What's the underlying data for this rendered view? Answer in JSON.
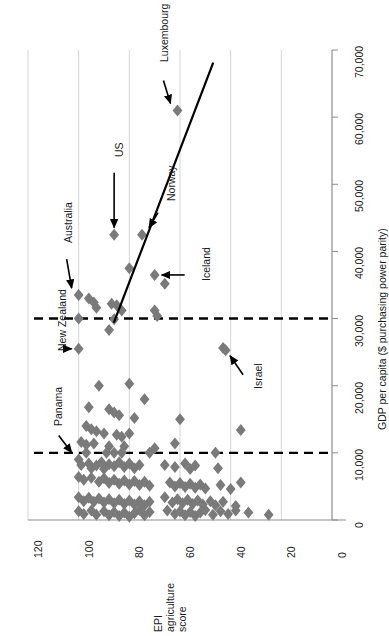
{
  "chart_data": {
    "type": "scatter",
    "title": "",
    "orientation": "rotated-90",
    "xlabel": "EPI agriculture score",
    "ylabel": "GDP per capita ($ purchasing power parity)",
    "xlim": [
      0,
      120
    ],
    "ylim": [
      0,
      70000
    ],
    "x_reversed": true,
    "grid": "x-gridlines-only",
    "legend": "none",
    "xticks": [
      120,
      100,
      80,
      60,
      40,
      20,
      0
    ],
    "xtick_labels": [
      "120",
      "100",
      "80",
      "60",
      "40",
      "20",
      "0"
    ],
    "yticks": [
      0,
      10000,
      20000,
      30000,
      40000,
      50000,
      60000,
      70000
    ],
    "ytick_labels": [
      "0",
      "10,000",
      "20,000",
      "30,000",
      "40,000",
      "50,000",
      "60,000",
      "70,000"
    ],
    "marker": {
      "shape": "diamond",
      "color": "#7a7a7a",
      "size": 6
    },
    "reference_lines": [
      {
        "axis": "gdp",
        "value": 30000,
        "style": "dashed",
        "color": "#000000"
      },
      {
        "axis": "gdp",
        "value": 10000,
        "style": "dashed",
        "color": "#000000"
      }
    ],
    "trendline": {
      "style": "solid",
      "color": "#000000",
      "width": 2.2,
      "from": {
        "epi": 86,
        "gdp": 29500
      },
      "to": {
        "epi": 47,
        "gdp": 68000
      }
    },
    "annotations": [
      {
        "label": "Luxembourg",
        "epi": 61,
        "gdp": 61000
      },
      {
        "label": "US",
        "epi": 86,
        "gdp": 42500
      },
      {
        "label": "Norway",
        "epi": 75,
        "gdp": 42500
      },
      {
        "label": "Iceland",
        "epi": 70,
        "gdp": 36500
      },
      {
        "label": "Australia",
        "epi": 100,
        "gdp": 33500
      },
      {
        "label": "New Zealand",
        "epi": 100,
        "gdp": 25500
      },
      {
        "label": "Panama",
        "epi": 100,
        "gdp": 9000
      },
      {
        "label": "Israel",
        "epi": 43,
        "gdp": 25500
      }
    ],
    "points": [
      {
        "epi": 61,
        "gdp": 61000
      },
      {
        "epi": 86,
        "gdp": 42500
      },
      {
        "epi": 75,
        "gdp": 42500
      },
      {
        "epi": 80,
        "gdp": 37500
      },
      {
        "epi": 70,
        "gdp": 36500
      },
      {
        "epi": 66,
        "gdp": 35200
      },
      {
        "epi": 100,
        "gdp": 33500
      },
      {
        "epi": 96,
        "gdp": 33000
      },
      {
        "epi": 94,
        "gdp": 32400
      },
      {
        "epi": 93,
        "gdp": 31600
      },
      {
        "epi": 87,
        "gdp": 32200
      },
      {
        "epi": 85,
        "gdp": 32000
      },
      {
        "epi": 83,
        "gdp": 31200
      },
      {
        "epi": 100,
        "gdp": 30000
      },
      {
        "epi": 86,
        "gdp": 29900
      },
      {
        "epi": 70,
        "gdp": 31200
      },
      {
        "epi": 69,
        "gdp": 30400
      },
      {
        "epi": 88,
        "gdp": 28300
      },
      {
        "epi": 100,
        "gdp": 25500
      },
      {
        "epi": 43,
        "gdp": 25600
      },
      {
        "epi": 42,
        "gdp": 25300
      },
      {
        "epi": 92,
        "gdp": 20000
      },
      {
        "epi": 80,
        "gdp": 20300
      },
      {
        "epi": 74,
        "gdp": 18000
      },
      {
        "epi": 96,
        "gdp": 16800
      },
      {
        "epi": 88,
        "gdp": 16500
      },
      {
        "epi": 86,
        "gdp": 16000
      },
      {
        "epi": 84,
        "gdp": 15600
      },
      {
        "epi": 78,
        "gdp": 15200
      },
      {
        "epi": 60,
        "gdp": 15000
      },
      {
        "epi": 97,
        "gdp": 14000
      },
      {
        "epi": 95,
        "gdp": 13500
      },
      {
        "epi": 93,
        "gdp": 13200
      },
      {
        "epi": 90,
        "gdp": 12900
      },
      {
        "epi": 85,
        "gdp": 12700
      },
      {
        "epi": 83,
        "gdp": 12400
      },
      {
        "epi": 80,
        "gdp": 12900
      },
      {
        "epi": 36,
        "gdp": 13400
      },
      {
        "epi": 99,
        "gdp": 11600
      },
      {
        "epi": 97,
        "gdp": 11200
      },
      {
        "epi": 94,
        "gdp": 11400
      },
      {
        "epi": 88,
        "gdp": 11000
      },
      {
        "epi": 82,
        "gdp": 11000
      },
      {
        "epi": 70,
        "gdp": 10700
      },
      {
        "epi": 62,
        "gdp": 11400
      },
      {
        "epi": 100,
        "gdp": 9000
      },
      {
        "epi": 97,
        "gdp": 10000
      },
      {
        "epi": 89,
        "gdp": 10000
      },
      {
        "epi": 86,
        "gdp": 10000
      },
      {
        "epi": 83,
        "gdp": 10000
      },
      {
        "epi": 72,
        "gdp": 10000
      },
      {
        "epi": 46,
        "gdp": 10000
      },
      {
        "epi": 99,
        "gdp": 8200
      },
      {
        "epi": 96,
        "gdp": 8400
      },
      {
        "epi": 95,
        "gdp": 7700
      },
      {
        "epi": 93,
        "gdp": 8100
      },
      {
        "epi": 91,
        "gdp": 8600
      },
      {
        "epi": 90,
        "gdp": 7600
      },
      {
        "epi": 88,
        "gdp": 8300
      },
      {
        "epi": 86,
        "gdp": 8000
      },
      {
        "epi": 84,
        "gdp": 8600
      },
      {
        "epi": 82,
        "gdp": 7900
      },
      {
        "epi": 80,
        "gdp": 8400
      },
      {
        "epi": 78,
        "gdp": 7700
      },
      {
        "epi": 76,
        "gdp": 8200
      },
      {
        "epi": 66,
        "gdp": 8200
      },
      {
        "epi": 62,
        "gdp": 7900
      },
      {
        "epi": 58,
        "gdp": 8400
      },
      {
        "epi": 56,
        "gdp": 7600
      },
      {
        "epi": 54,
        "gdp": 8100
      },
      {
        "epi": 45,
        "gdp": 7700
      },
      {
        "epi": 100,
        "gdp": 6400
      },
      {
        "epi": 98,
        "gdp": 6000
      },
      {
        "epi": 95,
        "gdp": 6300
      },
      {
        "epi": 92,
        "gdp": 5700
      },
      {
        "epi": 90,
        "gdp": 6200
      },
      {
        "epi": 88,
        "gdp": 5500
      },
      {
        "epi": 86,
        "gdp": 6000
      },
      {
        "epi": 84,
        "gdp": 5400
      },
      {
        "epi": 82,
        "gdp": 5900
      },
      {
        "epi": 80,
        "gdp": 5300
      },
      {
        "epi": 78,
        "gdp": 5800
      },
      {
        "epi": 76,
        "gdp": 5200
      },
      {
        "epi": 74,
        "gdp": 5700
      },
      {
        "epi": 72,
        "gdp": 5100
      },
      {
        "epi": 64,
        "gdp": 5600
      },
      {
        "epi": 62,
        "gdp": 5000
      },
      {
        "epi": 60,
        "gdp": 5500
      },
      {
        "epi": 58,
        "gdp": 4900
      },
      {
        "epi": 56,
        "gdp": 5400
      },
      {
        "epi": 54,
        "gdp": 4800
      },
      {
        "epi": 52,
        "gdp": 5300
      },
      {
        "epi": 50,
        "gdp": 4700
      },
      {
        "epi": 44,
        "gdp": 5200
      },
      {
        "epi": 40,
        "gdp": 4600
      },
      {
        "epi": 36,
        "gdp": 5600
      },
      {
        "epi": 100,
        "gdp": 3400
      },
      {
        "epi": 98,
        "gdp": 2800
      },
      {
        "epi": 96,
        "gdp": 3300
      },
      {
        "epi": 94,
        "gdp": 2700
      },
      {
        "epi": 92,
        "gdp": 3200
      },
      {
        "epi": 90,
        "gdp": 2600
      },
      {
        "epi": 88,
        "gdp": 3100
      },
      {
        "epi": 86,
        "gdp": 2500
      },
      {
        "epi": 84,
        "gdp": 3000
      },
      {
        "epi": 82,
        "gdp": 2400
      },
      {
        "epi": 80,
        "gdp": 2900
      },
      {
        "epi": 78,
        "gdp": 2300
      },
      {
        "epi": 76,
        "gdp": 2800
      },
      {
        "epi": 74,
        "gdp": 2200
      },
      {
        "epi": 72,
        "gdp": 2700
      },
      {
        "epi": 66,
        "gdp": 3400
      },
      {
        "epi": 63,
        "gdp": 2600
      },
      {
        "epi": 61,
        "gdp": 3100
      },
      {
        "epi": 59,
        "gdp": 2500
      },
      {
        "epi": 57,
        "gdp": 3000
      },
      {
        "epi": 55,
        "gdp": 2400
      },
      {
        "epi": 53,
        "gdp": 2900
      },
      {
        "epi": 51,
        "gdp": 2300
      },
      {
        "epi": 48,
        "gdp": 2800
      },
      {
        "epi": 46,
        "gdp": 2200
      },
      {
        "epi": 43,
        "gdp": 2700
      },
      {
        "epi": 38,
        "gdp": 2100
      },
      {
        "epi": 100,
        "gdp": 1300
      },
      {
        "epi": 98,
        "gdp": 900
      },
      {
        "epi": 95,
        "gdp": 1400
      },
      {
        "epi": 93,
        "gdp": 800
      },
      {
        "epi": 90,
        "gdp": 1300
      },
      {
        "epi": 88,
        "gdp": 700
      },
      {
        "epi": 86,
        "gdp": 1200
      },
      {
        "epi": 84,
        "gdp": 600
      },
      {
        "epi": 82,
        "gdp": 1100
      },
      {
        "epi": 80,
        "gdp": 500
      },
      {
        "epi": 78,
        "gdp": 1000
      },
      {
        "epi": 76,
        "gdp": 1500
      },
      {
        "epi": 74,
        "gdp": 700
      },
      {
        "epi": 72,
        "gdp": 1200
      },
      {
        "epi": 65,
        "gdp": 1400
      },
      {
        "epi": 62,
        "gdp": 900
      },
      {
        "epi": 60,
        "gdp": 1300
      },
      {
        "epi": 58,
        "gdp": 700
      },
      {
        "epi": 56,
        "gdp": 1200
      },
      {
        "epi": 54,
        "gdp": 600
      },
      {
        "epi": 52,
        "gdp": 1100
      },
      {
        "epi": 50,
        "gdp": 1500
      },
      {
        "epi": 47,
        "gdp": 800
      },
      {
        "epi": 44,
        "gdp": 1300
      },
      {
        "epi": 41,
        "gdp": 900
      },
      {
        "epi": 38,
        "gdp": 1400
      },
      {
        "epi": 33,
        "gdp": 1100
      },
      {
        "epi": 25,
        "gdp": 800
      }
    ]
  }
}
